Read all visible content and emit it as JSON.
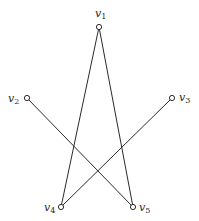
{
  "diagram": {
    "type": "graph",
    "width": 199,
    "height": 221,
    "stroke_color": "#2a2a2a",
    "background": "#ffffff",
    "vertices": [
      {
        "id": "v1",
        "name": "v",
        "sub": "1",
        "x": 99,
        "y": 27,
        "label_x": 95,
        "label_y": 17
      },
      {
        "id": "v2",
        "name": "v",
        "sub": "2",
        "x": 27,
        "y": 98,
        "label_x": 8,
        "label_y": 102
      },
      {
        "id": "v3",
        "name": "v",
        "sub": "3",
        "x": 172,
        "y": 98,
        "label_x": 179,
        "label_y": 101
      },
      {
        "id": "v4",
        "name": "v",
        "sub": "4",
        "x": 61,
        "y": 207,
        "label_x": 44,
        "label_y": 211
      },
      {
        "id": "v5",
        "name": "v",
        "sub": "5",
        "x": 133,
        "y": 207,
        "label_x": 139,
        "label_y": 211
      }
    ],
    "edges": [
      {
        "from": "v1",
        "to": "v4"
      },
      {
        "from": "v1",
        "to": "v5"
      },
      {
        "from": "v2",
        "to": "v5"
      },
      {
        "from": "v3",
        "to": "v4"
      }
    ]
  }
}
